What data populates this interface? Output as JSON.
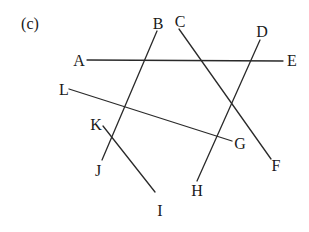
{
  "panel_label": "(c)",
  "segments": [
    {
      "name": "AE",
      "x1": 87,
      "y1": 60,
      "x2": 283,
      "y2": 61
    },
    {
      "name": "BJ",
      "x1": 157,
      "y1": 31,
      "x2": 102,
      "y2": 160
    },
    {
      "name": "CF",
      "x1": 179,
      "y1": 29,
      "x2": 271,
      "y2": 159
    },
    {
      "name": "DH",
      "x1": 260,
      "y1": 40,
      "x2": 197,
      "y2": 181
    },
    {
      "name": "LG",
      "x1": 69,
      "y1": 89,
      "x2": 232,
      "y2": 141
    },
    {
      "name": "KI",
      "x1": 103,
      "y1": 126,
      "x2": 155,
      "y2": 192
    }
  ],
  "points": {
    "A": {
      "label": "A",
      "x": 79,
      "y": 66
    },
    "B": {
      "label": "B",
      "x": 158,
      "y": 29
    },
    "C": {
      "label": "C",
      "x": 180,
      "y": 27
    },
    "D": {
      "label": "D",
      "x": 262,
      "y": 37
    },
    "E": {
      "label": "E",
      "x": 292,
      "y": 66
    },
    "F": {
      "label": "F",
      "x": 276,
      "y": 171
    },
    "G": {
      "label": "G",
      "x": 240,
      "y": 149
    },
    "H": {
      "label": "H",
      "x": 197,
      "y": 196
    },
    "I": {
      "label": "I",
      "x": 160,
      "y": 216
    },
    "J": {
      "label": "J",
      "x": 98,
      "y": 176
    },
    "K": {
      "label": "K",
      "x": 96,
      "y": 130
    },
    "L": {
      "label": "L",
      "x": 64,
      "y": 95
    }
  }
}
